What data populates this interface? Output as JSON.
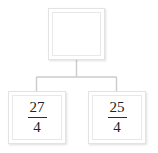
{
  "diagram": {
    "type": "tree",
    "title": "",
    "background_color": "#ffffff",
    "box_border_color": "#e3e3e3",
    "connector_color": "#c9c9c9",
    "text_color": "#232323",
    "parent": {
      "label": "",
      "content_type": "empty",
      "placeholder": ""
    },
    "children": [
      {
        "label": "27/4",
        "numerator": "27",
        "vinculum": "",
        "denominator": "4"
      },
      {
        "label": "25/4",
        "numerator": "25",
        "vinculum": "",
        "denominator": "4"
      }
    ],
    "connectors": {
      "stem_label": "",
      "branch_left_label": "",
      "branch_right_label": ""
    }
  }
}
